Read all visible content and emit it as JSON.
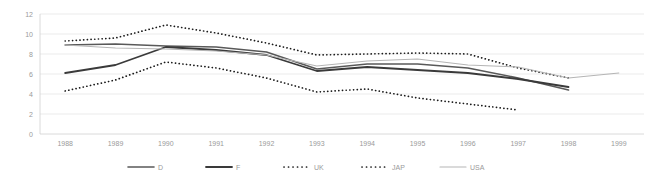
{
  "chart_data": {
    "type": "line",
    "title": "",
    "subtitle": "",
    "xlabel": "",
    "ylabel": "",
    "x": [
      1988,
      1989,
      1990,
      1991,
      1992,
      1993,
      1994,
      1995,
      1996,
      1997,
      1998,
      1999
    ],
    "categories": [
      "1988",
      "1989",
      "1990",
      "1991",
      "1992",
      "1993",
      "1994",
      "1995",
      "1996",
      "1997",
      "1998",
      "1999"
    ],
    "ylim": [
      0,
      12
    ],
    "yticks": [
      0,
      2,
      4,
      6,
      8,
      10,
      12
    ],
    "ytick_labels": [
      "0",
      "2",
      "4",
      "6",
      "8",
      "10",
      "12"
    ],
    "grid": true,
    "grid_axis": "y",
    "legend_position": "bottom",
    "series": [
      {
        "name": "D",
        "style": "solid",
        "color": "#595959",
        "width": 1.6,
        "values": [
          8.9,
          9.0,
          8.8,
          8.7,
          8.2,
          6.5,
          7.0,
          7.0,
          6.6,
          5.6,
          4.4,
          null
        ]
      },
      {
        "name": "F",
        "style": "solid",
        "color": "#3a3a3a",
        "width": 1.8,
        "values": [
          6.1,
          6.9,
          8.7,
          8.4,
          7.9,
          6.3,
          6.7,
          6.4,
          6.1,
          5.5,
          4.7,
          null
        ]
      },
      {
        "name": "UK",
        "style": "dotted",
        "color": "#1a1a1a",
        "width": 1.7,
        "values": [
          9.3,
          9.6,
          10.9,
          10.1,
          9.1,
          7.9,
          8.0,
          8.1,
          8.0,
          6.6,
          5.6,
          null
        ]
      },
      {
        "name": "JAP",
        "style": "dotted",
        "color": "#1a1a1a",
        "width": 1.7,
        "values": [
          4.3,
          5.4,
          7.2,
          6.6,
          5.6,
          4.2,
          4.5,
          3.6,
          3.0,
          2.4,
          null,
          null
        ]
      },
      {
        "name": "USA",
        "style": "solid",
        "color": "#b5b5b5",
        "width": 1.1,
        "values": [
          8.9,
          8.6,
          8.5,
          8.3,
          7.9,
          6.8,
          7.3,
          7.5,
          6.9,
          6.7,
          5.6,
          6.1
        ]
      }
    ],
    "legend": [
      {
        "label": "D",
        "style": "solid",
        "color": "#595959"
      },
      {
        "label": "F",
        "style": "solid",
        "color": "#3a3a3a"
      },
      {
        "label": "UK",
        "style": "dotted",
        "color": "#1a1a1a"
      },
      {
        "label": "JAP",
        "style": "dotted",
        "color": "#1a1a1a"
      },
      {
        "label": "USA",
        "style": "solid",
        "color": "#b5b5b5"
      }
    ],
    "colors": {
      "background": "#ffffff",
      "grid": "#e6e6e6",
      "axis": "#d0d0d0",
      "tick_label": "#9a9a9a"
    }
  }
}
